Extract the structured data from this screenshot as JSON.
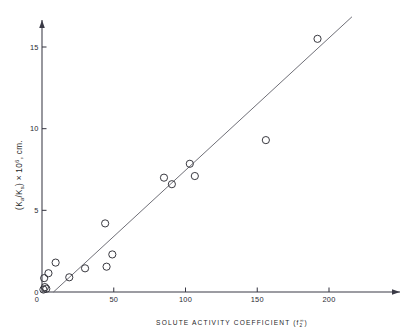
{
  "chart_data": {
    "type": "scatter",
    "title": "",
    "xlabel": "SOLUTE ACTIVITY COEFFICIENT (f2^∞)",
    "xlabel_main": "SOLUTE  ACTIVITY  COEFFICIENT",
    "xlabel_symbol_open": "(f",
    "xlabel_symbol_sub": "2",
    "xlabel_symbol_sup": "∞",
    "xlabel_symbol_close": ")",
    "ylabel": "(Ka/Ks) × 10^6, cm.",
    "ylabel_open": "(K",
    "ylabel_sub_a": "a",
    "ylabel_slash": "/K",
    "ylabel_sub_s": "s",
    "ylabel_close": ")",
    "ylabel_times": " × 10",
    "ylabel_exp": "6",
    "ylabel_units": ", cm.",
    "xlim": [
      0,
      232
    ],
    "ylim": [
      0,
      16.9
    ],
    "xticks": [
      0,
      50,
      100,
      150,
      200
    ],
    "xticklabels": [
      "0",
      "50",
      "100",
      "150",
      "200"
    ],
    "yticks": [
      0,
      5,
      10,
      15
    ],
    "yticklabels": [
      "0",
      "5",
      "10",
      "15"
    ],
    "grid": false,
    "legend": null,
    "marker": "open-circle",
    "series": [
      {
        "name": "solute data",
        "points": [
          {
            "x": 1.0,
            "y": 0.15
          },
          {
            "x": 2.0,
            "y": 0.3
          },
          {
            "x": 1.5,
            "y": 0.85
          },
          {
            "x": 3.0,
            "y": 0.2
          },
          {
            "x": 4.5,
            "y": 1.15
          },
          {
            "x": 9.5,
            "y": 1.8
          },
          {
            "x": 19.0,
            "y": 0.9
          },
          {
            "x": 30.0,
            "y": 1.45
          },
          {
            "x": 44.0,
            "y": 4.2
          },
          {
            "x": 45.0,
            "y": 1.55
          },
          {
            "x": 49.0,
            "y": 2.3
          },
          {
            "x": 85.0,
            "y": 7.0
          },
          {
            "x": 90.5,
            "y": 6.6
          },
          {
            "x": 103.0,
            "y": 7.85
          },
          {
            "x": 106.5,
            "y": 7.1
          },
          {
            "x": 156.0,
            "y": 9.3
          },
          {
            "x": 192.0,
            "y": 15.5
          }
        ]
      }
    ],
    "fit_line": {
      "name": "linear fit",
      "x_start": 8.0,
      "y_start": 0.0,
      "x_end": 216.0,
      "y_end": 16.85
    },
    "axis_arrows": {
      "x": true,
      "y": true
    },
    "colors": {
      "axis": "#3a3a46",
      "marker_stroke": "#2e2e36",
      "fit_line": "#55555f",
      "text": "#1f1f27",
      "background": "#ffffff"
    }
  }
}
